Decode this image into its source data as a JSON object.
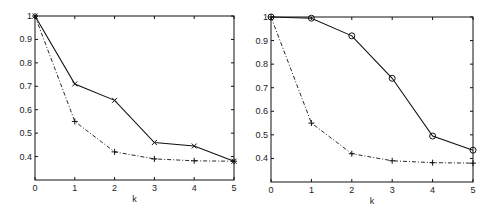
{
  "chart_data": [
    {
      "type": "line",
      "title": "",
      "xlabel": "k",
      "ylabel": "",
      "x": [
        0,
        1,
        2,
        3,
        4,
        5
      ],
      "xlim": [
        0,
        5
      ],
      "ylim": [
        0.3,
        1.0
      ],
      "xticks": [
        "0",
        "1",
        "2",
        "3",
        "4",
        "5"
      ],
      "yticks": [
        "0.4",
        "0.5",
        "0.6",
        "0.7",
        "0.8",
        "0.9",
        "1"
      ],
      "grid": false,
      "legend": null,
      "series": [
        {
          "name": "solid-x",
          "style": "solid",
          "marker": "x",
          "values": [
            1.0,
            0.71,
            0.64,
            0.46,
            0.445,
            0.38
          ]
        },
        {
          "name": "dashed-plus",
          "style": "dashdot",
          "marker": "+",
          "values": [
            1.0,
            0.55,
            0.42,
            0.39,
            0.382,
            0.38
          ]
        }
      ]
    },
    {
      "type": "line",
      "title": "",
      "xlabel": "k",
      "ylabel": "",
      "x": [
        0,
        1,
        2,
        3,
        4,
        5
      ],
      "xlim": [
        0,
        5
      ],
      "ylim": [
        0.3,
        1.0
      ],
      "xticks": [
        "0",
        "1",
        "2",
        "3",
        "4",
        "5"
      ],
      "yticks": [
        "0.4",
        "0.5",
        "0.6",
        "0.7",
        "0.8",
        "0.9",
        "1"
      ],
      "grid": false,
      "legend": null,
      "series": [
        {
          "name": "solid-circle",
          "style": "solid",
          "marker": "o",
          "values": [
            1.0,
            0.995,
            0.92,
            0.74,
            0.495,
            0.435
          ]
        },
        {
          "name": "dashed-plus",
          "style": "dashdot",
          "marker": "+",
          "values": [
            1.0,
            0.55,
            0.42,
            0.39,
            0.382,
            0.38
          ]
        }
      ]
    }
  ],
  "layout": {
    "panels": [
      {
        "left": 35,
        "right": 234,
        "top": 16,
        "bottom": 180
      },
      {
        "left": 271,
        "right": 473,
        "top": 17,
        "bottom": 182
      }
    ]
  }
}
